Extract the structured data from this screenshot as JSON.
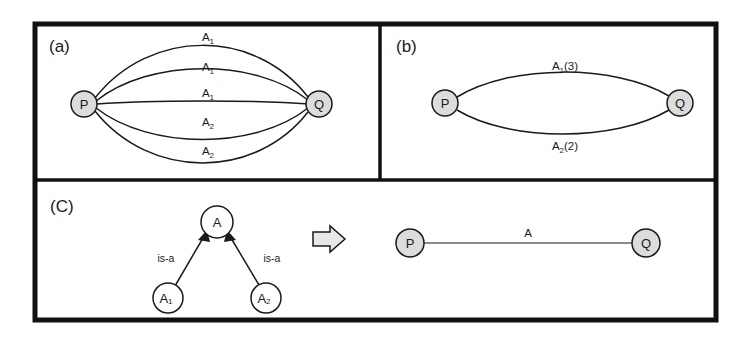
{
  "figure": {
    "panels": [
      {
        "id": "panel-a",
        "tag": "(a)",
        "nodes": [
          {
            "id": "p",
            "label": "P"
          },
          {
            "id": "q",
            "label": "Q"
          }
        ],
        "edges": [
          {
            "base": "A",
            "sub": "1",
            "label": "A1"
          },
          {
            "base": "A",
            "sub": "1",
            "label": "A1"
          },
          {
            "base": "A",
            "sub": "1",
            "label": "A1"
          },
          {
            "base": "A",
            "sub": "2",
            "label": "A2"
          },
          {
            "base": "A",
            "sub": "2",
            "label": "A2"
          }
        ]
      },
      {
        "id": "panel-b",
        "tag": "(b)",
        "nodes": [
          {
            "id": "p",
            "label": "P"
          },
          {
            "id": "q",
            "label": "Q"
          }
        ],
        "edges": [
          {
            "base": "A",
            "sub": "1",
            "count": "(3)",
            "label": "A1(3)"
          },
          {
            "base": "A",
            "sub": "2",
            "count": "(2)",
            "label": "A2(2)"
          }
        ]
      },
      {
        "id": "panel-c",
        "tag": "(C)",
        "hierarchy": {
          "parent": {
            "id": "a",
            "base": "A",
            "sub": ""
          },
          "children": [
            {
              "id": "a1",
              "base": "A",
              "sub": "1"
            },
            {
              "id": "a2",
              "base": "A",
              "sub": "2"
            }
          ],
          "relations": [
            {
              "from": "a1",
              "to": "a",
              "label": "is-a"
            },
            {
              "from": "a2",
              "to": "a",
              "label": "is-a"
            }
          ]
        },
        "transform_arrow": "rightwards-block-arrow",
        "result": {
          "nodes": [
            {
              "id": "p",
              "label": "P"
            },
            {
              "id": "q",
              "label": "Q"
            }
          ],
          "edges": [
            {
              "base": "A",
              "sub": "",
              "label": "A"
            }
          ]
        }
      }
    ]
  },
  "colors": {
    "node_fill": "#dcdcdc",
    "node_fill_white": "#ffffff",
    "stroke": "#1a1a1a",
    "frame": "#111111",
    "block_arrow_fill": "#e8e8e8",
    "background": "#ffffff"
  }
}
